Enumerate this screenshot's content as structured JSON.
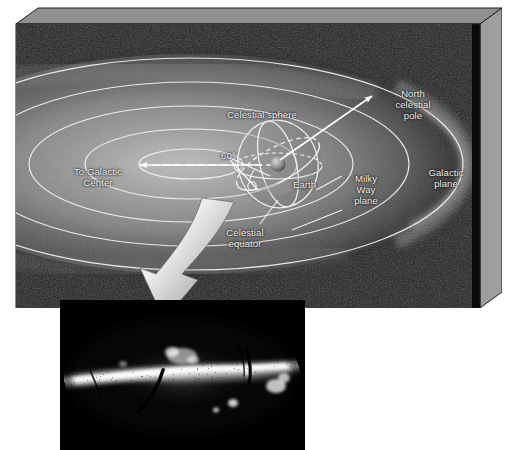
{
  "figure": {
    "background_color": "#ffffff"
  },
  "diagram": {
    "name": "galactic-plane-3d-box",
    "box": {
      "front_face_color": "#0a0a0a",
      "top_bevel_color": "#8d8d8d",
      "side_bevel_color": "#9a9a9a",
      "outline_color": "#2b2b2b"
    },
    "galaxy": {
      "disk_color": "#b9b9b9",
      "disk_glow_color": "#d8d8d8",
      "ring_color": "#f0f0f0",
      "ring_count": 5
    },
    "labels": [
      {
        "id": "celestial-sphere",
        "text": "Celestial sphere",
        "x": 246,
        "y": 91
      },
      {
        "id": "north-celestial-pole",
        "text": "North\ncelestial\npole",
        "x": 397,
        "y": 81
      },
      {
        "id": "to-galactic-center",
        "text": "To Galactic\nCenter",
        "x": 82,
        "y": 153
      },
      {
        "id": "angle-60",
        "text": "60°",
        "x": 212,
        "y": 132
      },
      {
        "id": "earth",
        "text": "Earth",
        "x": 297,
        "y": 161
      },
      {
        "id": "milky-way-plane",
        "text": "Milky\nWay\nplane",
        "x": 350,
        "y": 165
      },
      {
        "id": "galactic-plane",
        "text": "Galactic\nplane",
        "x": 430,
        "y": 154
      },
      {
        "id": "celestial-equator",
        "text": "Celestial\nequator",
        "x": 229,
        "y": 214
      }
    ],
    "arrows": {
      "to_galactic_center": {
        "name": "to-galactic-center-arrow",
        "color": "#ffffff",
        "direction": "left"
      },
      "north_celestial_pole": {
        "name": "north-celestial-pole-arrow",
        "color": "#ffffff",
        "direction": "up-right"
      },
      "callout_big": {
        "name": "sky-map-callout-arrow",
        "color_light": "#e6e6e6",
        "color_dark": "#6b6b6b",
        "direction": "down-left-curved"
      }
    },
    "earth": {
      "name": "earth-sphere",
      "color": "#9b9b9b"
    },
    "celestial_sphere": {
      "outline_color": "#efefef",
      "equator_style": "solid-and-dashed",
      "galactic_center_line_style": "dashed"
    }
  },
  "sky_map": {
    "name": "all-sky-milky-way-panel",
    "projection": "aitoff",
    "background_color": "#000000",
    "star_color": "#ffffff",
    "band_color": "#ffffff",
    "dust_lane_color": "#000000",
    "description": "All-sky star map showing the Milky Way band across the centre with dark dust lanes and bright star clouds"
  }
}
